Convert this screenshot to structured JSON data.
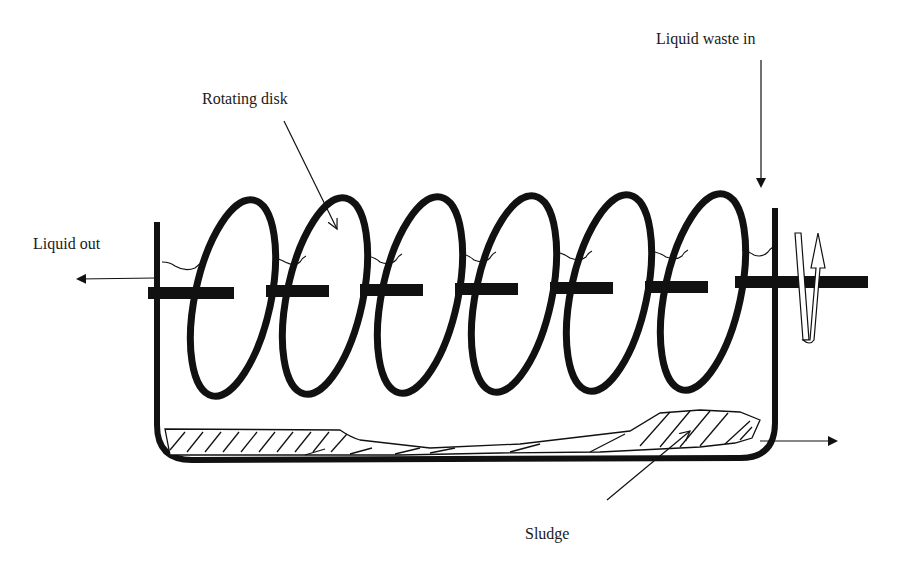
{
  "diagram": {
    "type": "rotating-biological-contactor",
    "labels": {
      "liquid_waste_in": "Liquid waste in",
      "rotating_disk": "Rotating disk",
      "liquid_out": "Liquid out",
      "sludge": "Sludge"
    },
    "disk_count": 6,
    "colors": {
      "stroke": "#111111",
      "background": "#ffffff"
    }
  }
}
